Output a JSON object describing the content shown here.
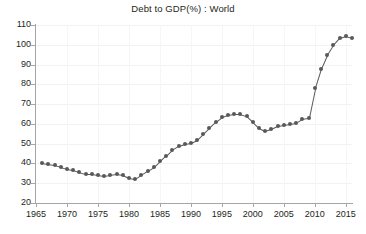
{
  "chart_data": {
    "type": "line",
    "title": "Debt to GDP(%) : World",
    "xlabel": "",
    "ylabel": "",
    "xlim": [
      1965,
      2016
    ],
    "ylim": [
      20,
      110
    ],
    "xticks": [
      1965,
      1970,
      1975,
      1980,
      1985,
      1990,
      1995,
      2000,
      2005,
      2010,
      2015
    ],
    "yticks": [
      20,
      30,
      40,
      50,
      60,
      70,
      80,
      90,
      100,
      110
    ],
    "grid": true,
    "legend": "none",
    "markers": "filled-circle",
    "series_color": "#58595b",
    "x": [
      1966,
      1967,
      1968,
      1969,
      1970,
      1971,
      1972,
      1973,
      1974,
      1975,
      1976,
      1977,
      1978,
      1979,
      1980,
      1981,
      1982,
      1983,
      1984,
      1985,
      1986,
      1987,
      1988,
      1989,
      1990,
      1991,
      1992,
      1993,
      1994,
      1995,
      1996,
      1997,
      1998,
      1999,
      2000,
      2001,
      2002,
      2003,
      2004,
      2005,
      2006,
      2007,
      2008,
      2009,
      2010,
      2011,
      2012,
      2013,
      2014,
      2015,
      2016
    ],
    "y": [
      40,
      39.5,
      39,
      38,
      37,
      36.5,
      35.5,
      34.5,
      34.5,
      34,
      33.5,
      34,
      34.5,
      34,
      32.5,
      32,
      34,
      36,
      38,
      41,
      44,
      47,
      49,
      50,
      50.5,
      52,
      55,
      58,
      61,
      63.5,
      64.5,
      65,
      65,
      64,
      61,
      58,
      56.5,
      57.5,
      59,
      59.5,
      60,
      60.5,
      62.5,
      63,
      78,
      88,
      95,
      100,
      103.5,
      104.5,
      103.5
    ],
    "series": [
      {
        "name": "World Debt to GDP",
        "values": [
          40,
          39.5,
          39,
          38,
          37,
          36.5,
          35.5,
          34.5,
          34.5,
          34,
          33.5,
          34,
          34.5,
          34,
          32.5,
          32,
          34,
          36,
          38,
          41,
          44,
          47,
          49,
          50,
          50.5,
          52,
          55,
          58,
          61,
          63.5,
          64.5,
          65,
          65,
          64,
          61,
          58,
          56.5,
          57.5,
          59,
          59.5,
          60,
          60.5,
          62.5,
          63,
          78,
          88,
          95,
          100,
          103.5,
          104.5,
          103.5
        ]
      }
    ]
  }
}
